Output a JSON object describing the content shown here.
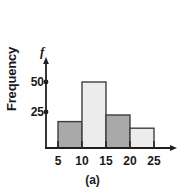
{
  "figure": {
    "caption": "(a)",
    "axis_symbol": "f",
    "ylabel": "Frequency"
  },
  "colors": {
    "bar_dark": "#a9a9a9",
    "bar_light": "#ececec",
    "bar_stroke": "#3f3f3f",
    "axis": "#231f20",
    "text": "#1a1a1a",
    "background": "#ffffff"
  },
  "chart_data": {
    "type": "bar",
    "title": "",
    "subtitle": "",
    "xlabel": "",
    "ylabel": "Frequency",
    "axis_symbol": "f",
    "caption": "(a)",
    "grid": false,
    "legend": "none",
    "bin_edges": [
      5,
      10,
      15,
      20,
      25
    ],
    "categories": [
      "5-10",
      "10-15",
      "15-20",
      "20-25"
    ],
    "values": [
      20,
      50,
      25,
      15
    ],
    "bar_fills": [
      "dark",
      "light",
      "dark",
      "light"
    ],
    "xticks": [
      5,
      10,
      15,
      20,
      25
    ],
    "xtick_labels": [
      "5",
      "10",
      "15",
      "20",
      "25"
    ],
    "yticks": [
      25,
      50
    ],
    "ytick_labels": [
      "25",
      "50"
    ],
    "xlim": [
      5,
      25
    ],
    "ylim": [
      0,
      58
    ]
  }
}
